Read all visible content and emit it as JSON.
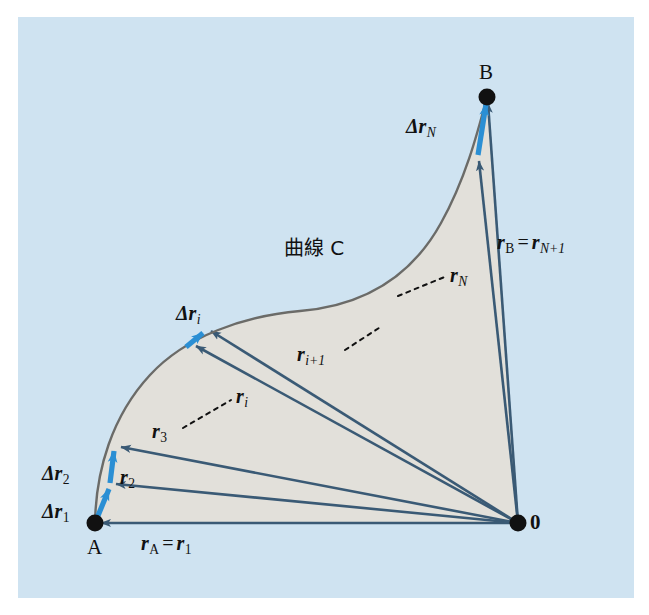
{
  "figure": {
    "domain": "Diagram",
    "panel_bg": "#cfe3f1",
    "page_bg": "#ffffff",
    "region_fill": "#e2e0da",
    "curve_color": "#6b6b68",
    "vector_color": "#3a5a75",
    "increment_color": "#2b8fd4",
    "point_color": "#111111"
  },
  "points": {
    "A": {
      "label": "A",
      "x": 95,
      "y": 523
    },
    "B": {
      "label": "B",
      "x": 487,
      "y": 97
    },
    "origin": {
      "label": "0",
      "x": 518,
      "y": 523
    }
  },
  "curve": {
    "name_label": "曲線 C",
    "description": "curve C from A to B"
  },
  "position_vectors": [
    {
      "name": "r_A = r_1",
      "base": "r",
      "sub": "A",
      "equals_sub": "1",
      "tip_x": 95,
      "tip_y": 523
    },
    {
      "name": "r_2",
      "base": "r",
      "sub": "2",
      "equals_sub": "",
      "tip_x": 110,
      "tip_y": 483
    },
    {
      "name": "r_3",
      "base": "r",
      "sub": "3",
      "equals_sub": "",
      "tip_x": 115,
      "tip_y": 445
    },
    {
      "name": "r_i",
      "base": "r",
      "sub": "i",
      "equals_sub": "",
      "tip_x": 190,
      "tip_y": 343
    },
    {
      "name": "r_i+1",
      "base": "r",
      "sub": "i+1",
      "equals_sub": "",
      "tip_x": 205,
      "tip_y": 329
    },
    {
      "name": "r_N",
      "base": "r",
      "sub": "N",
      "equals_sub": "",
      "tip_x": 478,
      "tip_y": 155
    },
    {
      "name": "r_B = r_N+1",
      "base": "r",
      "sub": "B",
      "equals_sub": "N+1",
      "tip_x": 487,
      "tip_y": 97
    }
  ],
  "increment_vectors": [
    {
      "name": "dr_1",
      "from_x": 95,
      "from_y": 523,
      "to_x": 110,
      "to_y": 483
    },
    {
      "name": "dr_2",
      "from_x": 110,
      "from_y": 483,
      "to_x": 115,
      "to_y": 445
    },
    {
      "name": "dr_i",
      "from_x": 190,
      "from_y": 343,
      "to_x": 205,
      "to_y": 329
    },
    {
      "name": "dr_N",
      "from_x": 478,
      "from_y": 155,
      "to_x": 487,
      "to_y": 97
    }
  ],
  "labels": {
    "point_A": "A",
    "point_B": "B",
    "origin": "0",
    "curve_name": "曲線 C",
    "delta_char": "Δ",
    "r_char": "r",
    "equals": "=",
    "sub_A": "A",
    "sub_B": "B",
    "sub_1": "1",
    "sub_2": "2",
    "sub_3": "3",
    "sub_i": "i",
    "sub_i_plus_1": "i+1",
    "sub_N": "N",
    "sub_N_plus_1": "N+1"
  },
  "leader_lines": [
    {
      "name": "leader-rN",
      "from_x": 398,
      "from_y": 296,
      "to_x": 447,
      "to_y": 276
    },
    {
      "name": "leader-ri1",
      "from_x": 345,
      "from_y": 350,
      "to_x": 380,
      "to_y": 327
    },
    {
      "name": "leader-ri",
      "from_x": 182,
      "from_y": 428,
      "to_x": 231,
      "to_y": 400
    }
  ]
}
